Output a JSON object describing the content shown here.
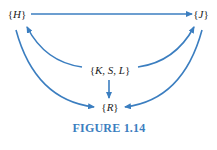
{
  "diagram": {
    "type": "directed-graph",
    "arrow_color": "#3b7ec0",
    "caption_color": "#3b7ec0",
    "text_color": "#222222",
    "nodes": [
      {
        "id": "H",
        "label": "{H}"
      },
      {
        "id": "J",
        "label": "{J}"
      },
      {
        "id": "KSL",
        "label": "{K, S, L}"
      },
      {
        "id": "R",
        "label": "{R}"
      }
    ],
    "edges": [
      {
        "from": "H",
        "to": "J"
      },
      {
        "from": "KSL",
        "to": "H"
      },
      {
        "from": "KSL",
        "to": "J"
      },
      {
        "from": "KSL",
        "to": "R"
      },
      {
        "from": "H",
        "to": "R"
      },
      {
        "from": "J",
        "to": "R"
      }
    ],
    "caption": "FIGURE 1.14"
  }
}
